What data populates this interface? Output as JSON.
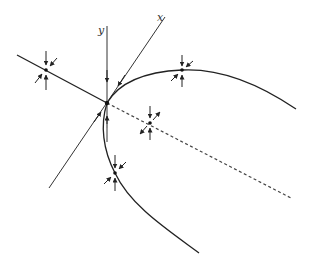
{
  "diagram": {
    "type": "phase-portrait",
    "colors": {
      "line": "#222222",
      "dashed": "#444444",
      "background": "#ffffff"
    },
    "axes": {
      "y_label": "y",
      "x_label": "x"
    },
    "origin": {
      "x": 107,
      "y": 103
    },
    "fixed_points": [
      {
        "name": "left-line-point",
        "x": 46,
        "y": 70
      },
      {
        "name": "top-curve-point",
        "x": 182,
        "y": 70
      },
      {
        "name": "dashed-line-point",
        "x": 150,
        "y": 123
      },
      {
        "name": "lower-curve-point",
        "x": 115,
        "y": 173
      }
    ]
  }
}
